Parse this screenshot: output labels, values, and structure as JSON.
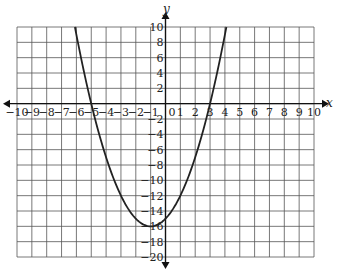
{
  "chart_data": {
    "type": "line",
    "title": "",
    "xlabel": "x",
    "ylabel": "y",
    "xlim": [
      -10,
      10
    ],
    "ylim": [
      -20,
      10
    ],
    "grid": true,
    "x_ticks": [
      -10,
      -9,
      -8,
      -7,
      -6,
      -5,
      -4,
      -3,
      -2,
      -1,
      0,
      1,
      2,
      3,
      4,
      5,
      6,
      7,
      8,
      9,
      10
    ],
    "y_ticks": [
      10,
      8,
      6,
      4,
      2,
      -2,
      -4,
      -6,
      -8,
      -10,
      -12,
      -14,
      -16,
      -18,
      -20
    ],
    "x_tick_labels": [
      "−10",
      "−9",
      "−8",
      "−7",
      "−6",
      "−5",
      "−4",
      "−3",
      "−2",
      "−1",
      "0",
      "1",
      "2",
      "3",
      "4",
      "5",
      "6",
      "7",
      "8",
      "9",
      "10"
    ],
    "y_tick_labels": [
      "10",
      "8",
      "6",
      "4",
      "2",
      "−2",
      "−4",
      "−6",
      "−8",
      "−10",
      "−12",
      "−14",
      "−16",
      "−18",
      "−20"
    ],
    "series": [
      {
        "name": "parabola",
        "equation": "y = x^2 + 2x - 15",
        "roots": [
          -5,
          3
        ],
        "vertex": [
          -1,
          -16
        ],
        "x": [
          -6.1,
          -6,
          -5,
          -4,
          -3,
          -2,
          -1,
          0,
          1,
          2,
          3,
          4,
          4.1
        ],
        "y": [
          10,
          9,
          0,
          -7,
          -12,
          -15,
          -16,
          -15,
          -12,
          -7,
          0,
          9,
          10
        ],
        "color": "#222222"
      }
    ]
  }
}
